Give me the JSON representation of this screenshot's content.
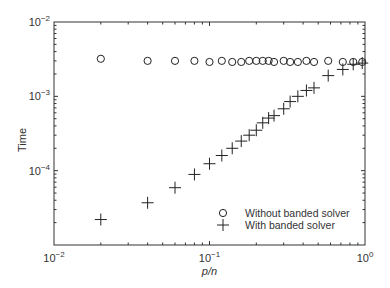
{
  "chart_data": {
    "type": "scatter",
    "title": "",
    "xlabel": "p/n",
    "ylabel": "Time",
    "xscale": "log",
    "yscale": "log",
    "xlim": [
      0.01,
      1
    ],
    "ylim": [
      1e-05,
      0.01
    ],
    "grid": false,
    "legend_position": "lower right",
    "x_ticks": [
      {
        "value": 0.01,
        "label_base": "10",
        "label_exp": "−2"
      },
      {
        "value": 0.1,
        "label_base": "10",
        "label_exp": "−1"
      },
      {
        "value": 1,
        "label_base": "10",
        "label_exp": "0"
      }
    ],
    "y_ticks": [
      {
        "value": 0.01,
        "label_base": "10",
        "label_exp": "−2"
      },
      {
        "value": 0.001,
        "label_base": "10",
        "label_exp": "−3"
      },
      {
        "value": 0.0001,
        "label_base": "10",
        "label_exp": "−4"
      }
    ],
    "x": [
      0.02,
      0.04,
      0.06,
      0.08,
      0.1,
      0.12,
      0.14,
      0.16,
      0.18,
      0.2,
      0.22,
      0.24,
      0.26,
      0.3,
      0.33,
      0.37,
      0.42,
      0.47,
      0.58,
      0.72,
      0.84,
      0.96
    ],
    "series": [
      {
        "name": "Without banded solver",
        "marker": "circle",
        "values": [
          0.0032,
          0.003,
          0.003,
          0.003,
          0.0029,
          0.003,
          0.0029,
          0.0029,
          0.003,
          0.003,
          0.003,
          0.003,
          0.0029,
          0.003,
          0.0029,
          0.0029,
          0.003,
          0.0029,
          0.003,
          0.0029,
          0.0029,
          0.0029
        ]
      },
      {
        "name": "With banded solver",
        "marker": "plus",
        "values": [
          2.2e-05,
          3.7e-05,
          5.9e-05,
          8.9e-05,
          0.000124,
          0.00016,
          0.0002,
          0.00025,
          0.0003,
          0.00035,
          0.00044,
          0.00051,
          0.00055,
          0.00068,
          0.00085,
          0.001,
          0.0012,
          0.0013,
          0.0019,
          0.0023,
          0.0027,
          0.0028
        ]
      }
    ]
  }
}
